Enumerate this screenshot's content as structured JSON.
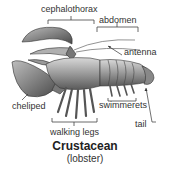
{
  "diagram": {
    "title": "Crustacean",
    "subtitle": "(lobster)",
    "labels": {
      "cephalothorax": "cephalothorax",
      "abdomen": "abdomen",
      "antenna": "antenna",
      "cheliped": "cheliped",
      "swimmerets": "swimmerets",
      "tail": "tail",
      "walking_legs": "walking legs"
    }
  }
}
